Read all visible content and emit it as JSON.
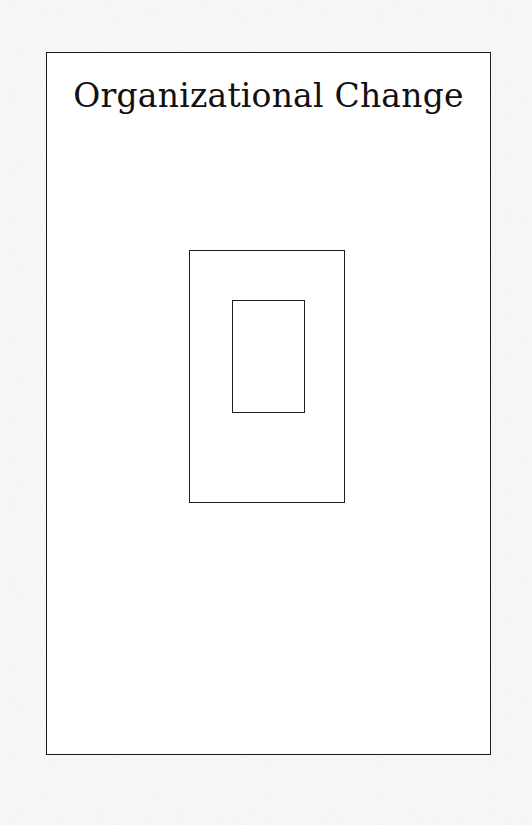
{
  "slide": {
    "title": "Organizational Change",
    "background_color": "#ffffff",
    "border_color": "#1a1a1a",
    "canvas_color": "#f6f6f6"
  },
  "diagram": {
    "type": "nested-rectangles",
    "stroke_color": "#1d1d1d",
    "fill_color": "transparent",
    "shapes": [
      {
        "name": "outer-rectangle",
        "label": "",
        "x": 189,
        "y": 250,
        "width": 156,
        "height": 253
      },
      {
        "name": "inner-rectangle",
        "label": "",
        "x": 232,
        "y": 300,
        "width": 73,
        "height": 113
      }
    ]
  }
}
